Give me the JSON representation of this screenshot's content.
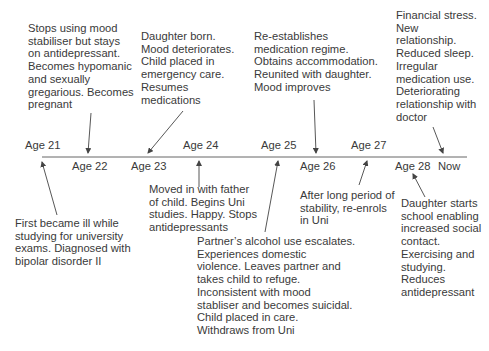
{
  "timeline": {
    "title": "",
    "axis_color": "#555555",
    "labels_above": [
      {
        "text": "Age 21",
        "x": 25,
        "y": 139
      },
      {
        "text": "Age 24",
        "x": 183,
        "y": 139
      },
      {
        "text": "Age 25",
        "x": 261,
        "y": 139
      },
      {
        "text": "Age 27",
        "x": 351,
        "y": 139
      }
    ],
    "labels_below": [
      {
        "text": "Age 22",
        "x": 72,
        "y": 160
      },
      {
        "text": "Age 23",
        "x": 131,
        "y": 160
      },
      {
        "text": "Age 26",
        "x": 300,
        "y": 160
      },
      {
        "text": "Age 28",
        "x": 395,
        "y": 160
      },
      {
        "text": "Now",
        "x": 438,
        "y": 160
      }
    ]
  },
  "events_above": [
    {
      "id": "age22",
      "lines": [
        "Stops using mood",
        "stabiliser but stays",
        "on antidepressant.",
        "Becomes hypomanic",
        "and sexually",
        "gregarious. Becomes",
        "pregnant"
      ]
    },
    {
      "id": "age23",
      "lines": [
        "Daughter born.",
        "Mood deteriorates.",
        "Child placed in",
        "emergency care.",
        "Resumes",
        "medications"
      ]
    },
    {
      "id": "age26",
      "lines": [
        "Re-establishes",
        "medication regime.",
        "Obtains accommodation.",
        "Reunited with daughter.",
        "Mood improves"
      ]
    },
    {
      "id": "now",
      "lines": [
        "Financial stress.",
        "New",
        "relationship.",
        "Reduced sleep.",
        "Irregular",
        "medication use.",
        "Deteriorating",
        "relationship with",
        "doctor"
      ]
    }
  ],
  "events_below": [
    {
      "id": "age21",
      "lines": [
        "First became ill while",
        "studying for university",
        "exams. Diagnosed with",
        "bipolar disorder II"
      ]
    },
    {
      "id": "age24",
      "lines": [
        "Moved in with father",
        "of child. Begins Uni",
        "studies. Happy. Stops",
        "antidepressants"
      ]
    },
    {
      "id": "age25",
      "lines": [
        "Partner’s alcohol use escalates.",
        "Experiences domestic",
        "violence. Leaves partner and",
        "takes child to refuge.",
        "Inconsistent with mood",
        "stabliser and becomes suicidal.",
        "Child placed in care.",
        "Withdraws from Uni"
      ]
    },
    {
      "id": "age27",
      "lines": [
        "After long period of",
        "stability, re-enrols",
        "in Uni"
      ]
    },
    {
      "id": "age28",
      "lines": [
        "Daughter starts",
        "school enabling",
        "increased social",
        "contact.",
        "Exercising and",
        "studying.",
        "Reduces",
        "antidepressant"
      ]
    }
  ]
}
